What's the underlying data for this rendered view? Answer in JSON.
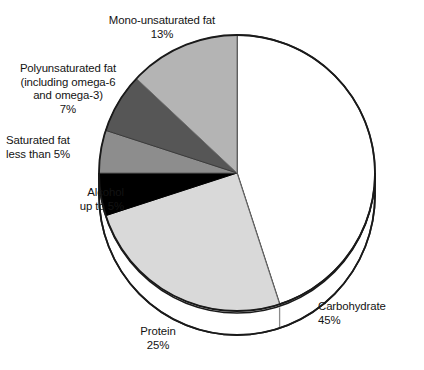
{
  "chart_data": {
    "type": "pie",
    "title": "",
    "subtitle": "",
    "xlabel": "",
    "ylabel": "",
    "legend_position": "none",
    "grid": false,
    "style": "3d-pie",
    "start_angle_deg": 0,
    "direction": "clockwise",
    "units": "percent of total energy intake",
    "categories": [
      "Carbohydrate",
      "Protein",
      "Alcohol",
      "Saturated fat",
      "Polyunsaturated fat (including omega-6 and omega-3)",
      "Mono-unsaturated fat"
    ],
    "values": [
      45,
      25,
      5,
      5,
      7,
      13
    ],
    "value_labels": [
      "45%",
      "25%",
      "up to 5%",
      "less than 5%",
      "7%",
      "13%"
    ],
    "colors": [
      "#ffffff",
      "#d9d9d9",
      "#000000",
      "#8d8d8d",
      "#565656",
      "#b4b4b4"
    ],
    "slices": [
      {
        "name": "Carbohydrate",
        "value": 45,
        "value_label": "45%",
        "color": "#ffffff",
        "label_lines": [
          "Carbohydrate",
          "45%"
        ]
      },
      {
        "name": "Protein",
        "value": 25,
        "value_label": "25%",
        "color": "#d9d9d9",
        "label_lines": [
          "Protein",
          "25%"
        ]
      },
      {
        "name": "Alcohol",
        "value": 5,
        "value_label": "up to 5%",
        "color": "#000000",
        "label_lines": [
          "Alcohol",
          "up to 5%"
        ]
      },
      {
        "name": "Saturated fat",
        "value": 5,
        "value_label": "less than 5%",
        "color": "#8d8d8d",
        "label_lines": [
          "Saturated fat",
          "less than 5%"
        ]
      },
      {
        "name": "Polyunsaturated fat",
        "value": 7,
        "value_label": "7%",
        "color": "#565656",
        "label_lines": [
          "Polyunsaturated fat",
          "(including omega-6",
          "and omega-3)",
          "7%"
        ]
      },
      {
        "name": "Mono-unsaturated fat",
        "value": 13,
        "value_label": "13%",
        "color": "#b4b4b4",
        "label_lines": [
          "Mono-unsaturated fat",
          "13%"
        ]
      }
    ]
  },
  "labels": {
    "mono": {
      "line1": "Mono-unsaturated fat",
      "line2": "13%"
    },
    "poly": {
      "line1": "Polyunsaturated fat",
      "line2": "(including omega-6",
      "line3": "and omega-3)",
      "line4": "7%"
    },
    "saturated": {
      "line1": "Saturated fat",
      "line2": "less than 5%"
    },
    "alcohol": {
      "line1": "Alcohol",
      "line2": "up to 5%"
    },
    "carbohydrate": {
      "line1": "Carbohydrate",
      "line2": "45%"
    },
    "protein": {
      "line1": "Protein",
      "line2": "25%"
    }
  },
  "colors": {
    "outline": "#1a1a1a",
    "background": "#ffffff",
    "text": "#131313"
  }
}
